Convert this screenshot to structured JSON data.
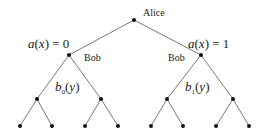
{
  "diagram": {
    "type": "game-tree",
    "root": {
      "id": "alice",
      "label": "Alice",
      "x": 134,
      "y": 20
    },
    "branch_labels": {
      "left": {
        "func": "a",
        "arg": "x",
        "eq": "= 0"
      },
      "right": {
        "func": "a",
        "arg": "x",
        "eq": "= 1"
      }
    },
    "bob_labels": {
      "left": "Bob",
      "right": "Bob"
    },
    "strategy_labels": {
      "left": {
        "func": "b",
        "sub": "0",
        "arg": "y"
      },
      "right": {
        "func": "b",
        "sub": "1",
        "arg": "y"
      }
    },
    "nodes": {
      "level1": [
        {
          "x": 134,
          "y": 20
        }
      ],
      "level2": [
        {
          "x": 69,
          "y": 55
        },
        {
          "x": 201,
          "y": 55
        }
      ],
      "level3": [
        {
          "x": 37,
          "y": 99
        },
        {
          "x": 101,
          "y": 99
        },
        {
          "x": 167,
          "y": 99
        },
        {
          "x": 233,
          "y": 99
        }
      ],
      "leaves": [
        {
          "x": 20,
          "y": 126
        },
        {
          "x": 52,
          "y": 126
        },
        {
          "x": 85,
          "y": 126
        },
        {
          "x": 118,
          "y": 126
        },
        {
          "x": 151,
          "y": 126
        },
        {
          "x": 183,
          "y": 126
        },
        {
          "x": 216,
          "y": 126
        },
        {
          "x": 249,
          "y": 126
        }
      ]
    }
  }
}
